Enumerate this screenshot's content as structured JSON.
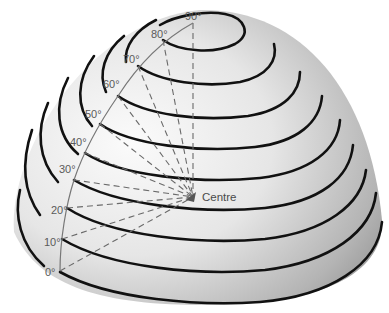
{
  "diagram": {
    "centre_label": "Centre",
    "latitude_labels": [
      "0°",
      "10°",
      "20°",
      "30°",
      "40°",
      "50°",
      "60°",
      "70°",
      "80°",
      "90°"
    ],
    "colors": {
      "latitude_lines": "#111111",
      "meridian": "#777777",
      "dashed_radii": "#6a6a6a",
      "label_text": "#5a5a5a",
      "dome_light": "#f4f4f4",
      "dome_dark": "#8a8a8a"
    }
  }
}
